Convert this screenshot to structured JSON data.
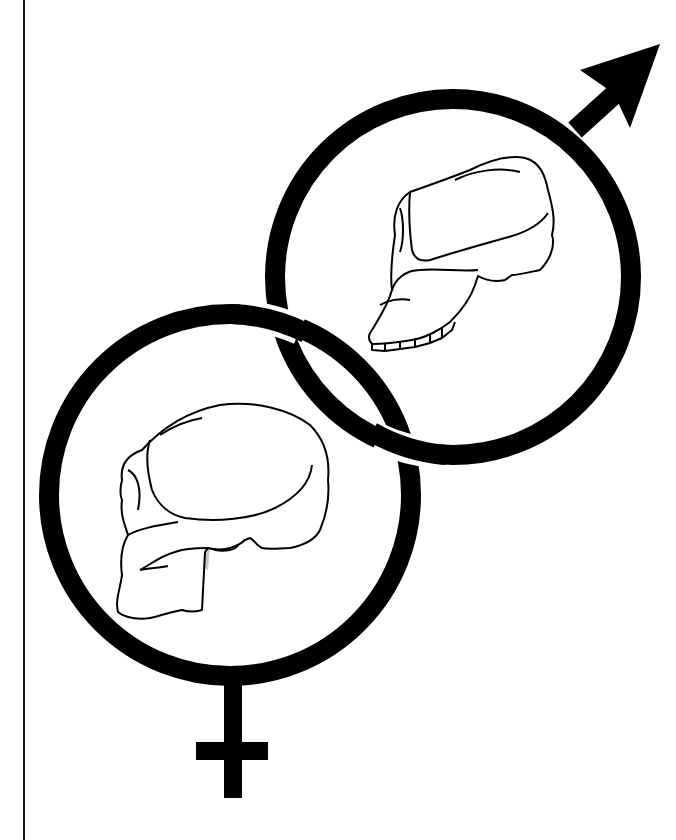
{
  "illustration": {
    "subject": "Interlocked male and female symbols each enclosing a hominin skull in side view",
    "colors": {
      "background": "#ffffff",
      "ink": "#000000",
      "shading": "#c8c8c8",
      "margin_rule": "#1a1a1a"
    },
    "male_symbol": {
      "label": "male-symbol",
      "center": [
        453,
        277
      ],
      "radius": 178,
      "stroke_width": 20,
      "arrow_tip": [
        660,
        44
      ],
      "contents": "robust ape-like skull with prognathic jaw (upper-right)"
    },
    "female_symbol": {
      "label": "female-symbol",
      "center": [
        230,
        495
      ],
      "radius": 181,
      "stroke_width": 20,
      "cross_center": [
        232,
        752
      ],
      "contents": "rounded cranium hominin skull (lower-left)"
    }
  }
}
